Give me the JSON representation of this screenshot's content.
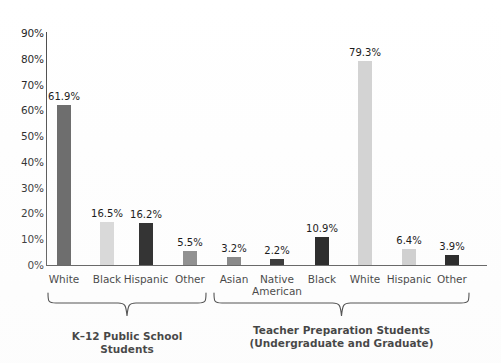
{
  "chart_data": {
    "type": "bar",
    "title": "",
    "xlabel": "",
    "ylabel": "",
    "ylim": [
      0,
      90
    ],
    "grid": false,
    "legend": "none",
    "ytick_labels": [
      "90%",
      "80%",
      "70%",
      "60%",
      "50%",
      "40%",
      "30%",
      "20%",
      "10%",
      "0%"
    ],
    "ytick_values": [
      90,
      80,
      70,
      60,
      50,
      40,
      30,
      20,
      10,
      0
    ],
    "groups": [
      {
        "caption": "K–12 Public School Students",
        "categories": [
          "White",
          "Black",
          "Hispanic",
          "Other"
        ],
        "values": [
          61.9,
          16.5,
          16.2,
          5.5
        ],
        "value_labels": [
          "61.9%",
          "16.5%",
          "16.2%",
          "5.5%"
        ],
        "bar_colors": [
          "#6e6e6e",
          "#d9d9d9",
          "#343434",
          "#919191"
        ]
      },
      {
        "caption": "Teacher Preparation Students\n(Undergraduate and Graduate)",
        "categories": [
          "Asian",
          "Native\nAmerican",
          "Black",
          "White",
          "Hispanic",
          "Other"
        ],
        "values": [
          3.2,
          2.2,
          10.9,
          79.3,
          6.4,
          3.9
        ],
        "value_labels": [
          "3.2%",
          "2.2%",
          "10.9%",
          "79.3%",
          "6.4%",
          "3.9%"
        ],
        "bar_colors": [
          "#8a8a8a",
          "#3d3d3d",
          "#2e2e2e",
          "#d3d3d3",
          "#d0d0d0",
          "#2e2e2e"
        ]
      }
    ],
    "axis_color": "#4a4a4a",
    "text_color": "#1c1c1c",
    "background": "#ffffff"
  }
}
